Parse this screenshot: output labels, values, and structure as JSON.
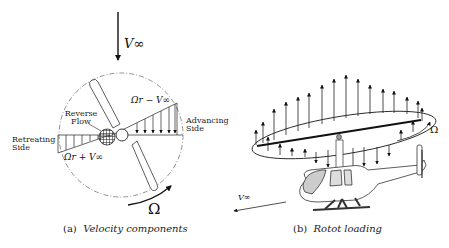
{
  "panel_a": {
    "caption_tag": "(a)",
    "caption_text": "Velocity components",
    "freestream_label": "V∞",
    "reverse_flow_label_line1": "Reverse",
    "reverse_flow_label_line2": "Flow",
    "advancing_label_line1": "Advancing",
    "advancing_label_line2": "Side",
    "retreating_label_line1": "Retreating",
    "retreating_label_line2": "Side",
    "advancing_velocity": "Ωr − V∞",
    "retreating_velocity": "Ωr + V∞",
    "rotation_label": "Ω"
  },
  "panel_b": {
    "caption_tag": "(b)",
    "caption_text": "Rotot loading",
    "rotation_label": "Ω",
    "freestream_label": "V∞"
  }
}
